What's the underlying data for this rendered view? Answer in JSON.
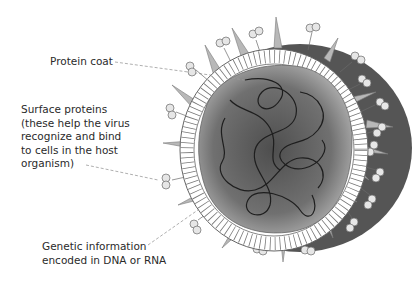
{
  "diagram": {
    "labels": {
      "protein_coat": "Protein coat",
      "surface_proteins": [
        "Surface proteins",
        "(these help the virus",
        "recognize and bind",
        "to cells in the host",
        "organism)"
      ],
      "genetic_info": [
        "Genetic information",
        "encoded in DNA or RNA"
      ]
    },
    "colors": {
      "text": "#2a2a2a",
      "leader": "#9a9a9a",
      "outer_shell": "#555555",
      "core": "#6e6e6e",
      "spike": "#b5b5b5",
      "ring": "#ffffff"
    }
  }
}
